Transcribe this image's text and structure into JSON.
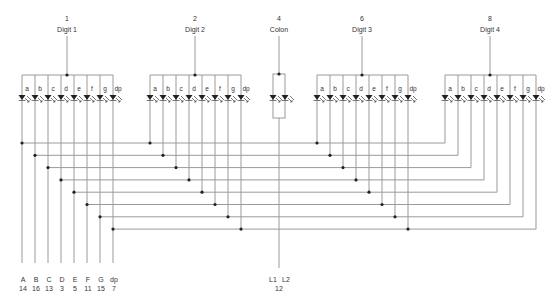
{
  "diagram": {
    "segments": [
      "a",
      "b",
      "c",
      "d",
      "e",
      "f",
      "g",
      "dp"
    ],
    "digits": [
      {
        "pin": "1",
        "label": "Digit 1",
        "x0": 22
      },
      {
        "pin": "2",
        "label": "Digit 2",
        "x0": 150
      },
      {
        "pin": "6",
        "label": "Digit 3",
        "x0": 317
      },
      {
        "pin": "8",
        "label": "Digit 4",
        "x0": 445
      }
    ],
    "colon": {
      "pin": "4",
      "label": "Colon",
      "x": 279,
      "leds": [
        "L1",
        "L2"
      ],
      "bottom_pin": "12"
    },
    "segment_pins": [
      {
        "name": "A",
        "pin": "14"
      },
      {
        "name": "B",
        "pin": "16"
      },
      {
        "name": "C",
        "pin": "13"
      },
      {
        "name": "D",
        "pin": "3"
      },
      {
        "name": "E",
        "pin": "5"
      },
      {
        "name": "F",
        "pin": "11"
      },
      {
        "name": "G",
        "pin": "15"
      },
      {
        "name": "dp",
        "pin": "7"
      }
    ],
    "colors": {
      "wire": "#9a9a9a",
      "node": "#222222",
      "text": "#333333"
    }
  }
}
